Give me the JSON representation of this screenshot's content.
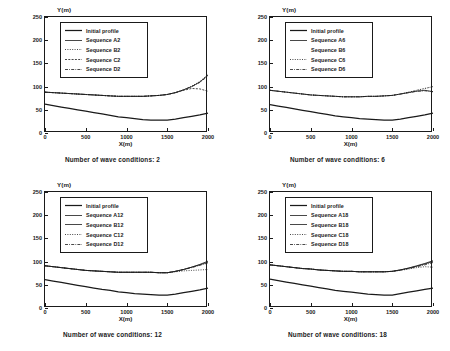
{
  "figure": {
    "type": "multi-panel-line-chart",
    "panel_count": 4,
    "axis": {
      "xlabel": "X(m)",
      "ylabel": "Y(m)",
      "xticks": [
        "0",
        "500",
        "1000",
        "1500",
        "2000"
      ],
      "yticks": [
        "0",
        "50",
        "100",
        "150",
        "200",
        "250"
      ],
      "xlim": [
        0,
        2000
      ],
      "ylim": [
        0,
        250
      ],
      "grid": false
    }
  },
  "chart_data": [
    {
      "type": "line",
      "id": "panel-1",
      "title": "Number of wave conditions: 2",
      "xlabel": "X(m)",
      "ylabel": "Y(m)",
      "xlim": [
        0,
        2000
      ],
      "ylim": [
        0,
        250
      ],
      "grid": false,
      "legend_position": "upper-left",
      "x": [
        0,
        100,
        200,
        300,
        400,
        500,
        600,
        700,
        800,
        900,
        1000,
        1100,
        1200,
        1300,
        1400,
        1500,
        1600,
        1700,
        1800,
        1900,
        2000
      ],
      "series": [
        {
          "name": "Initial profile",
          "style": "solid-thick",
          "values": [
            62,
            59,
            56,
            53,
            50,
            47,
            44,
            41,
            38,
            35,
            33,
            31,
            29,
            28,
            28,
            28,
            30,
            33,
            36,
            39,
            43
          ]
        },
        {
          "name": "Sequence A2",
          "style": "solid-thin",
          "values": [
            88,
            87,
            86,
            85,
            84,
            83,
            82,
            81,
            80,
            79,
            79,
            79,
            79,
            80,
            81,
            83,
            87,
            93,
            100,
            110,
            125
          ]
        },
        {
          "name": "Sequence B2",
          "style": "dotted",
          "values": [
            88,
            87,
            86,
            85,
            84,
            83,
            82,
            81,
            80,
            79,
            79,
            79,
            79,
            80,
            81,
            83,
            87,
            93,
            101,
            111,
            126
          ]
        },
        {
          "name": "Sequence C2",
          "style": "dashed-fine",
          "values": [
            88,
            87,
            86,
            85,
            84,
            83,
            82,
            81,
            80,
            79,
            79,
            79,
            79,
            80,
            81,
            83,
            87,
            92,
            96,
            95,
            90
          ]
        },
        {
          "name": "Sequence D2",
          "style": "dash-dot",
          "values": [
            88,
            87,
            86,
            85,
            84,
            83,
            82,
            81,
            80,
            79,
            79,
            79,
            79,
            80,
            81,
            83,
            87,
            93,
            100,
            109,
            123
          ]
        }
      ]
    },
    {
      "type": "line",
      "id": "panel-2",
      "title": "Number of wave conditions: 6",
      "xlabel": "X(m)",
      "ylabel": "Y(m)",
      "xlim": [
        0,
        2000
      ],
      "ylim": [
        0,
        250
      ],
      "grid": false,
      "legend_position": "upper-left",
      "x": [
        0,
        100,
        200,
        300,
        400,
        500,
        600,
        700,
        800,
        900,
        1000,
        1100,
        1200,
        1300,
        1400,
        1500,
        1600,
        1700,
        1800,
        1900,
        2000
      ],
      "series": [
        {
          "name": "Initial profile",
          "style": "solid-thick",
          "values": [
            61,
            58,
            55,
            52,
            49,
            46,
            43,
            40,
            37,
            35,
            33,
            31,
            30,
            29,
            28,
            28,
            30,
            33,
            36,
            39,
            43
          ]
        },
        {
          "name": "Sequence A6",
          "style": "solid-thin",
          "values": [
            92,
            90,
            88,
            86,
            84,
            82,
            81,
            80,
            79,
            78,
            78,
            78,
            79,
            79,
            80,
            81,
            84,
            87,
            90,
            92,
            89
          ]
        },
        {
          "name": "Sequence B6",
          "style": "blank",
          "values": [
            92,
            90,
            88,
            86,
            84,
            82,
            81,
            80,
            79,
            78,
            78,
            78,
            79,
            79,
            80,
            81,
            84,
            88,
            92,
            96,
            100
          ]
        },
        {
          "name": "Sequence C6",
          "style": "dotted",
          "values": [
            92,
            90,
            88,
            86,
            84,
            82,
            81,
            80,
            79,
            78,
            78,
            78,
            79,
            79,
            80,
            81,
            84,
            88,
            92,
            96,
            100
          ]
        },
        {
          "name": "Sequence D6",
          "style": "dash-dot",
          "values": [
            92,
            90,
            88,
            86,
            84,
            82,
            81,
            80,
            79,
            78,
            78,
            78,
            79,
            79,
            80,
            81,
            84,
            87,
            90,
            91,
            89
          ]
        }
      ]
    },
    {
      "type": "line",
      "id": "panel-3",
      "title": "Number of wave conditions: 12",
      "xlabel": "X(m)",
      "ylabel": "Y(m)",
      "xlim": [
        0,
        2000
      ],
      "ylim": [
        0,
        250
      ],
      "grid": false,
      "legend_position": "upper-left",
      "x": [
        0,
        100,
        200,
        300,
        400,
        500,
        600,
        700,
        800,
        900,
        1000,
        1100,
        1200,
        1300,
        1400,
        1500,
        1600,
        1700,
        1800,
        1900,
        2000
      ],
      "series": [
        {
          "name": "Initial profile",
          "style": "solid-thick",
          "values": [
            61,
            58,
            55,
            52,
            49,
            46,
            43,
            40,
            38,
            35,
            33,
            31,
            30,
            29,
            28,
            28,
            30,
            33,
            36,
            39,
            43
          ]
        },
        {
          "name": "Sequence A12",
          "style": "solid-thin",
          "values": [
            91,
            89,
            87,
            85,
            83,
            81,
            80,
            79,
            78,
            77,
            77,
            77,
            77,
            77,
            76,
            76,
            79,
            83,
            88,
            94,
            101
          ]
        },
        {
          "name": "Sequence B12",
          "style": "solid-thin",
          "values": [
            91,
            89,
            87,
            85,
            83,
            81,
            80,
            79,
            78,
            77,
            77,
            77,
            77,
            77,
            76,
            76,
            79,
            83,
            88,
            93,
            99
          ]
        },
        {
          "name": "Sequence C12",
          "style": "dotted",
          "values": [
            91,
            89,
            87,
            85,
            83,
            81,
            80,
            79,
            78,
            77,
            77,
            77,
            77,
            77,
            76,
            76,
            78,
            80,
            81,
            82,
            83
          ]
        },
        {
          "name": "Sequence D12",
          "style": "dash-dot",
          "values": [
            91,
            89,
            87,
            85,
            83,
            81,
            80,
            79,
            78,
            77,
            77,
            77,
            77,
            77,
            76,
            76,
            79,
            83,
            87,
            92,
            97
          ]
        }
      ]
    },
    {
      "type": "line",
      "id": "panel-4",
      "title": "Number of wave conditions: 18",
      "xlabel": "X(m)",
      "ylabel": "Y(m)",
      "xlim": [
        0,
        2000
      ],
      "ylim": [
        0,
        250
      ],
      "grid": false,
      "legend_position": "upper-left",
      "x": [
        0,
        100,
        200,
        300,
        400,
        500,
        600,
        700,
        800,
        900,
        1000,
        1100,
        1200,
        1300,
        1400,
        1500,
        1600,
        1700,
        1800,
        1900,
        2000
      ],
      "series": [
        {
          "name": "Initial profile",
          "style": "solid-thick",
          "values": [
            62,
            59,
            56,
            53,
            50,
            47,
            44,
            41,
            38,
            36,
            34,
            32,
            30,
            29,
            28,
            28,
            31,
            34,
            37,
            40,
            43
          ]
        },
        {
          "name": "Sequence A18",
          "style": "solid-thin",
          "values": [
            93,
            91,
            89,
            87,
            85,
            84,
            82,
            81,
            80,
            79,
            79,
            78,
            78,
            78,
            78,
            79,
            82,
            86,
            91,
            96,
            102
          ]
        },
        {
          "name": "Sequence B18",
          "style": "solid-thin",
          "values": [
            93,
            91,
            89,
            87,
            85,
            84,
            82,
            81,
            80,
            79,
            79,
            78,
            78,
            78,
            78,
            79,
            82,
            86,
            90,
            95,
            100
          ]
        },
        {
          "name": "Sequence C18",
          "style": "dotted",
          "values": [
            93,
            91,
            89,
            87,
            85,
            84,
            82,
            81,
            80,
            79,
            79,
            78,
            78,
            78,
            78,
            79,
            81,
            84,
            87,
            89,
            88
          ]
        },
        {
          "name": "Sequence D18",
          "style": "dash-dot",
          "values": [
            93,
            91,
            89,
            87,
            85,
            84,
            82,
            81,
            80,
            79,
            79,
            78,
            78,
            78,
            78,
            79,
            82,
            85,
            89,
            93,
            98
          ]
        }
      ]
    }
  ],
  "colors": {
    "ink": "#1a1a1a",
    "background": "#ffffff"
  }
}
